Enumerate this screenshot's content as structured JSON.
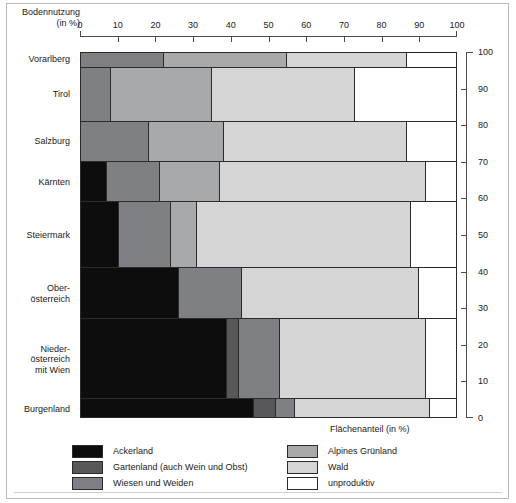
{
  "header": {
    "title_line1": "Bodennutzung",
    "title_line2": "(in %)"
  },
  "axis_bottom_right_title": "Flächenanteil (in %)",
  "top_axis": {
    "ticks": [
      "0",
      "10",
      "20",
      "30",
      "40",
      "50",
      "60",
      "70",
      "80",
      "90",
      "100"
    ]
  },
  "right_axis": {
    "ticks": [
      "0",
      "10",
      "20",
      "30",
      "40",
      "50",
      "60",
      "70",
      "80",
      "90",
      "100"
    ]
  },
  "legend": {
    "items": [
      {
        "label": "Ackerland",
        "color": "#0d0d0d"
      },
      {
        "label": "Gartenland (auch Wein und Obst)",
        "color": "#58585a"
      },
      {
        "label": "Wiesen und Weiden",
        "color": "#7f8083"
      },
      {
        "label": "Alpines Grünland",
        "color": "#a8a9ab"
      },
      {
        "label": "Wald",
        "color": "#d4d5d4"
      },
      {
        "label": "unproduktiv",
        "color": "#ffffff"
      }
    ]
  },
  "chart_data": {
    "type": "bar",
    "title": "Bodennutzung (in %)",
    "xlabel": "Bodennutzung (in %)",
    "ylabel": "Flächenanteil (in %)",
    "xlim": [
      0,
      100
    ],
    "ylim": [
      0,
      100
    ],
    "grid": false,
    "orientation": "horizontal-stacked-marimekko",
    "categories": [
      "Vorarlberg",
      "Tirol",
      "Salzburg",
      "Kärnten",
      "Steiermark",
      "Ober-\nösterreich",
      "Nieder-\nösterreich\nmit Wien",
      "Burgenland"
    ],
    "category_labels": [
      [
        "Vorarlberg"
      ],
      [
        "Tirol"
      ],
      [
        "Salzburg"
      ],
      [
        "Kärnten"
      ],
      [
        "Steiermark"
      ],
      [
        "Ober-",
        "österreich"
      ],
      [
        "Nieder-",
        "österreich",
        "mit Wien"
      ],
      [
        "Burgenland"
      ]
    ],
    "series": [
      {
        "name": "Ackerland",
        "color": "#0d0d0d",
        "values": [
          0,
          0,
          0,
          7,
          10,
          26,
          39,
          46
        ]
      },
      {
        "name": "Gartenland (auch Wein und Obst)",
        "color": "#58585a",
        "values": [
          0,
          0,
          0,
          0,
          0,
          0,
          3,
          6
        ]
      },
      {
        "name": "Wiesen und Weiden",
        "color": "#7f8083",
        "values": [
          22,
          8,
          18,
          14,
          14,
          17,
          11,
          5
        ]
      },
      {
        "name": "Alpines Grünland",
        "color": "#a8a9ab",
        "values": [
          33,
          27,
          20,
          16,
          7,
          0,
          0,
          0
        ]
      },
      {
        "name": "Wald",
        "color": "#d4d5d4",
        "values": [
          32,
          38,
          49,
          55,
          57,
          47,
          39,
          36
        ]
      },
      {
        "name": "unproduktiv",
        "color": "#ffffff",
        "values": [
          13,
          27,
          13,
          8,
          12,
          10,
          8,
          7
        ]
      }
    ],
    "bar_heights_percent_of_total_area": [
      4,
      15,
      11,
      11,
      18,
      14,
      22,
      5
    ],
    "bar_y_ranges": [
      [
        96,
        100
      ],
      [
        81,
        96
      ],
      [
        70,
        81
      ],
      [
        59,
        70
      ],
      [
        41,
        59
      ],
      [
        27,
        41
      ],
      [
        5,
        27
      ],
      [
        0,
        5
      ]
    ]
  }
}
